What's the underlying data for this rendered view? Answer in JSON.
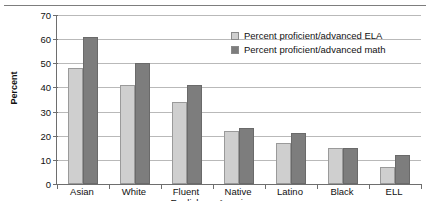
{
  "chart_data": {
    "type": "bar",
    "title": "",
    "subtitle": "",
    "xlabel": "",
    "ylabel": "Percent",
    "ylim": [
      0,
      70
    ],
    "yticks": [
      0,
      10,
      20,
      30,
      40,
      50,
      60,
      70
    ],
    "grid": true,
    "legend_position": "top-right",
    "categories": [
      "Asian",
      "White",
      "Fluent English",
      "Native American",
      "Latino",
      "Black",
      "ELL"
    ],
    "category_lines": [
      [
        "Asian"
      ],
      [
        "White"
      ],
      [
        "Fluent",
        "English"
      ],
      [
        "Native",
        "American"
      ],
      [
        "Latino"
      ],
      [
        "Black"
      ],
      [
        "ELL"
      ]
    ],
    "series": [
      {
        "name": "Percent proficient/advanced ELA",
        "color": "#cfcfcf",
        "values": [
          48,
          41,
          34,
          22,
          17,
          15,
          7
        ]
      },
      {
        "name": "Percent proficient/advanced math",
        "color": "#7d7d7d",
        "values": [
          61,
          50,
          41,
          23,
          21,
          15,
          12
        ]
      }
    ]
  },
  "legend": {
    "items": [
      {
        "label": "Percent proficient/advanced ELA",
        "swatch": "light-gray-swatch"
      },
      {
        "label": "Percent proficient/advanced math",
        "swatch": "dark-gray-swatch"
      }
    ]
  },
  "axis": {
    "y_title": "Percent"
  }
}
